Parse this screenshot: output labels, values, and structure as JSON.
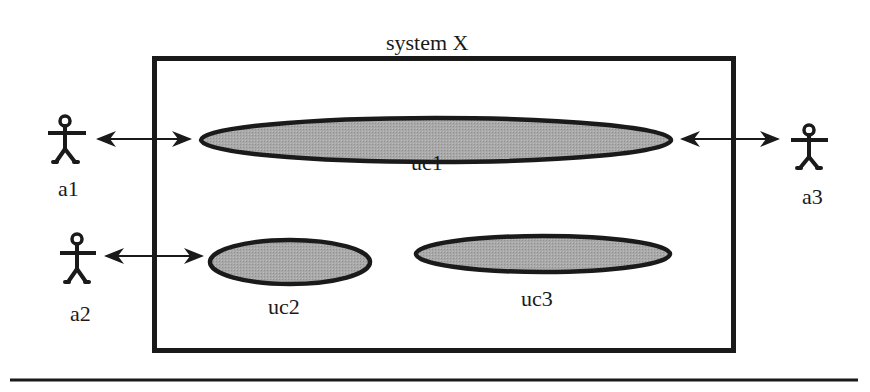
{
  "diagram": {
    "type": "uml-use-case",
    "system": {
      "title": "system X"
    },
    "actors": [
      {
        "id": "a1",
        "label": "a1"
      },
      {
        "id": "a2",
        "label": "a2"
      },
      {
        "id": "a3",
        "label": "a3"
      }
    ],
    "use_cases": [
      {
        "id": "uc1",
        "label": "uc1"
      },
      {
        "id": "uc2",
        "label": "uc2"
      },
      {
        "id": "uc3",
        "label": "uc3"
      }
    ],
    "associations": [
      {
        "from": "a1",
        "to": "uc1",
        "arrow": "bidirectional"
      },
      {
        "from": "a3",
        "to": "uc1",
        "arrow": "bidirectional"
      },
      {
        "from": "a2",
        "to": "uc2",
        "arrow": "bidirectional"
      }
    ],
    "colors": {
      "stroke": "#1a1a1a",
      "use_case_fill": "#a9a9a9",
      "background": "#ffffff"
    }
  }
}
